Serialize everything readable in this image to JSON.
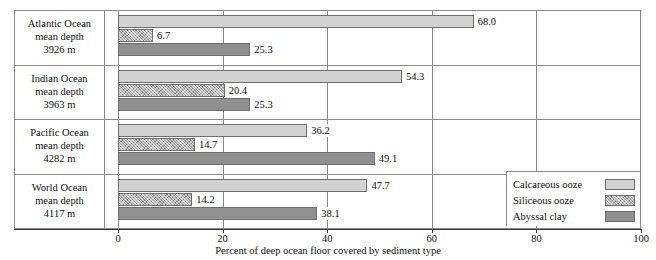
{
  "chart_data": {
    "type": "bar",
    "orientation": "horizontal",
    "title": "",
    "xlabel": "Percent of deep ocean floor covered by sediment type",
    "ylabel": "",
    "xlim": [
      0,
      100
    ],
    "xticks": [
      0,
      20,
      40,
      60,
      80,
      100
    ],
    "grid": true,
    "legend_position": "bottom-right",
    "categories": [
      "Atlantic Ocean mean depth 3926 m",
      "Indian Ocean mean depth 3963 m",
      "Pacific Ocean mean depth 4282 m",
      "World Ocean mean depth 4117 m"
    ],
    "series": [
      {
        "name": "Calcareous ooze",
        "color": "#d2d2d2",
        "values": [
          68.0,
          54.3,
          36.2,
          47.7
        ]
      },
      {
        "name": "Siliceous ooze",
        "color": "#b0b0b0",
        "values": [
          6.7,
          20.4,
          14.7,
          14.2
        ]
      },
      {
        "name": "Abyssal clay",
        "color": "#909090",
        "values": [
          25.3,
          25.3,
          49.1,
          38.1
        ]
      }
    ]
  },
  "groups": [
    {
      "name": "Atlantic Ocean",
      "label_lines": [
        "Atlantic Ocean",
        "mean depth",
        "3926 m"
      ],
      "bars": [
        {
          "series": "Calcareous ooze",
          "value": 68.0,
          "value_label": "68.0"
        },
        {
          "series": "Siliceous ooze",
          "value": 6.7,
          "value_label": "6.7"
        },
        {
          "series": "Abyssal clay",
          "value": 25.3,
          "value_label": "25.3"
        }
      ]
    },
    {
      "name": "Indian Ocean",
      "label_lines": [
        "Indian Ocean",
        "mean depth",
        "3963 m"
      ],
      "bars": [
        {
          "series": "Calcareous ooze",
          "value": 54.3,
          "value_label": "54.3"
        },
        {
          "series": "Siliceous ooze",
          "value": 20.4,
          "value_label": "20.4"
        },
        {
          "series": "Abyssal clay",
          "value": 25.3,
          "value_label": "25.3"
        }
      ]
    },
    {
      "name": "Pacific Ocean",
      "label_lines": [
        "Pacific Ocean",
        "mean depth",
        "4282 m"
      ],
      "bars": [
        {
          "series": "Calcareous ooze",
          "value": 36.2,
          "value_label": "36.2"
        },
        {
          "series": "Siliceous ooze",
          "value": 14.7,
          "value_label": "14.7"
        },
        {
          "series": "Abyssal clay",
          "value": 49.1,
          "value_label": "49.1"
        }
      ]
    },
    {
      "name": "World Ocean",
      "label_lines": [
        "World Ocean",
        "mean depth",
        "4117 m"
      ],
      "bars": [
        {
          "series": "Calcareous ooze",
          "value": 47.7,
          "value_label": "47.7"
        },
        {
          "series": "Siliceous ooze",
          "value": 14.2,
          "value_label": "14.2"
        },
        {
          "series": "Abyssal clay",
          "value": 38.1,
          "value_label": "38.1"
        }
      ]
    }
  ],
  "axis": {
    "ticks": [
      {
        "value": 0,
        "label": "0"
      },
      {
        "value": 20,
        "label": "20"
      },
      {
        "value": 40,
        "label": "40"
      },
      {
        "value": 60,
        "label": "60"
      },
      {
        "value": 80,
        "label": "80"
      },
      {
        "value": 100,
        "label": "100"
      }
    ],
    "title": "Percent of deep ocean floor covered by sediment type"
  },
  "legend": {
    "items": [
      {
        "label": "Calcareous ooze",
        "color": "#d2d2d2",
        "pattern": "solid-light"
      },
      {
        "label": "Siliceous ooze",
        "color": "#b0b0b0",
        "pattern": "speckled"
      },
      {
        "label": "Abyssal clay",
        "color": "#909090",
        "pattern": "solid-dark"
      }
    ]
  }
}
